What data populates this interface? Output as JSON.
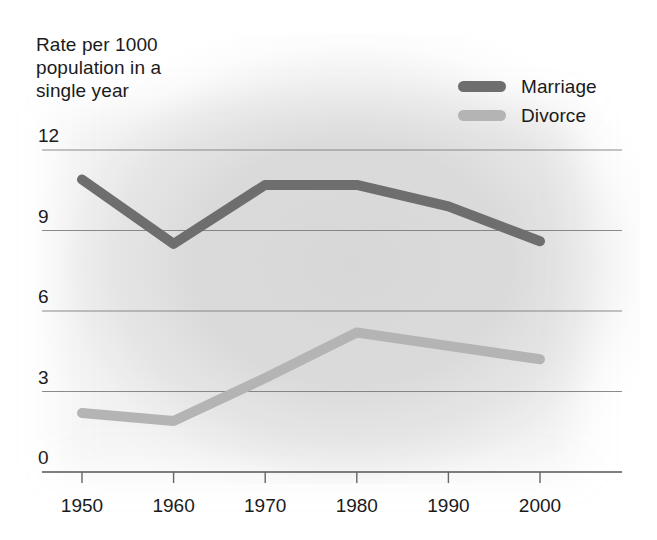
{
  "chart_data": {
    "type": "line",
    "title": "",
    "ylabel": "Rate per 1000\npopulation in a\nsingle year",
    "xlabel": "",
    "categories": [
      "1950",
      "1960",
      "1970",
      "1980",
      "1990",
      "2000"
    ],
    "x": [
      1950,
      1960,
      1970,
      1980,
      1990,
      2000
    ],
    "series": [
      {
        "name": "Marriage",
        "color": "#6e6e6e",
        "values": [
          10.9,
          8.5,
          10.7,
          10.7,
          9.9,
          8.6
        ]
      },
      {
        "name": "Divorce",
        "color": "#b4b4b4",
        "values": [
          2.2,
          1.9,
          3.5,
          5.2,
          4.7,
          4.2
        ]
      }
    ],
    "ylim": [
      0,
      12
    ],
    "yticks": [
      0,
      3,
      6,
      9,
      12
    ],
    "ytick_labels": [
      "0",
      "3",
      "6",
      "9",
      "12"
    ],
    "xlim": [
      1950,
      2000
    ],
    "grid": true,
    "grid_color": "#777777",
    "legend_position": "top-right"
  },
  "axis": {
    "y_title_line1": "Rate per 1000",
    "y_title_line2": "population in a",
    "y_title_line3": "single year"
  },
  "legend": {
    "items": [
      {
        "label": "Marriage",
        "color": "#6e6e6e"
      },
      {
        "label": "Divorce",
        "color": "#b4b4b4"
      }
    ]
  },
  "yticks": [
    {
      "label": "12"
    },
    {
      "label": "9"
    },
    {
      "label": "6"
    },
    {
      "label": "3"
    },
    {
      "label": "0"
    }
  ],
  "xticks": [
    {
      "label": "1950"
    },
    {
      "label": "1960"
    },
    {
      "label": "1970"
    },
    {
      "label": "1980"
    },
    {
      "label": "1990"
    },
    {
      "label": "2000"
    }
  ],
  "colors": {
    "marriage": "#6e6e6e",
    "divorce": "#b4b4b4",
    "grid": "#777777",
    "text": "#1b1b1b"
  }
}
